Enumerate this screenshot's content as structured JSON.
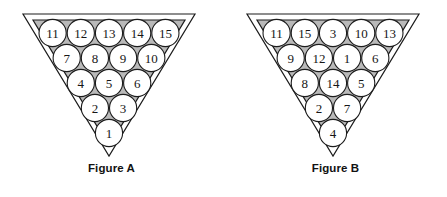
{
  "figures": [
    {
      "id": "figure-a",
      "caption": "Figure A",
      "rows": [
        [
          11,
          12,
          13,
          14,
          15
        ],
        [
          7,
          8,
          9,
          10
        ],
        [
          4,
          5,
          6
        ],
        [
          2,
          3
        ],
        [
          1
        ]
      ]
    },
    {
      "id": "figure-b",
      "caption": "Figure B",
      "rows": [
        [
          11,
          15,
          3,
          10,
          13
        ],
        [
          9,
          12,
          1,
          6
        ],
        [
          8,
          14,
          5
        ],
        [
          2,
          7
        ],
        [
          4
        ]
      ]
    }
  ],
  "colors": {
    "background": "#ffffff",
    "rack_fill": "#b9b9b9",
    "rack_stroke": "#1c1c1c",
    "ball_fill": "#ffffff",
    "ball_stroke": "#1c1c1c",
    "number_color": "#161616",
    "caption_color": "#121212"
  },
  "geometry": {
    "ball_radius": 13.6,
    "ball_spacing_x": 28.2,
    "ball_spacing_y": 25.0,
    "top_row_y": 33.0,
    "center_x": 109.0
  }
}
